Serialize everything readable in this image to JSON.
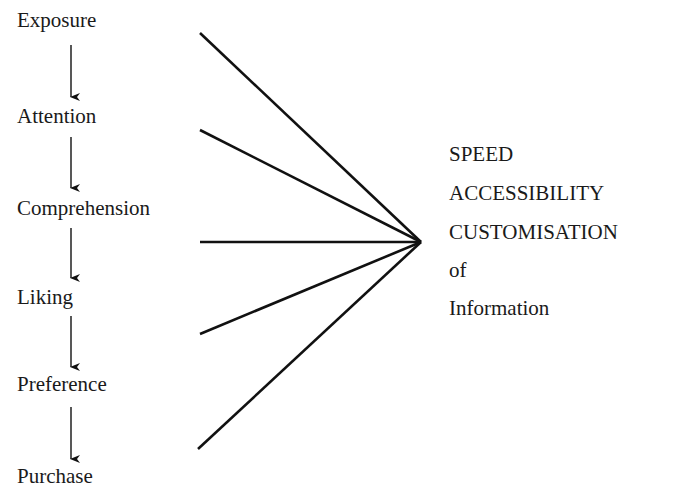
{
  "diagram": {
    "type": "flow",
    "stages": [
      {
        "label": "Exposure",
        "y": 10
      },
      {
        "label": "Attention",
        "y": 106
      },
      {
        "label": "Comprehension",
        "y": 198
      },
      {
        "label": "Liking",
        "y": 287
      },
      {
        "label": "Preference",
        "y": 374
      },
      {
        "label": "Purchase",
        "y": 466
      }
    ],
    "target_lines": [
      "SPEED",
      "ACCESSIBILITY",
      "CUSTOMISATION",
      "of",
      "Information"
    ],
    "convergence_point": {
      "x": 421,
      "y": 242
    },
    "line_origins": [
      {
        "x": 200,
        "y": 33
      },
      {
        "x": 200,
        "y": 130
      },
      {
        "x": 200,
        "y": 242
      },
      {
        "x": 200,
        "y": 334
      },
      {
        "x": 198,
        "y": 449
      }
    ],
    "colors": {
      "line": "#111111",
      "text": "#1a1a1a",
      "background": "#ffffff"
    }
  }
}
